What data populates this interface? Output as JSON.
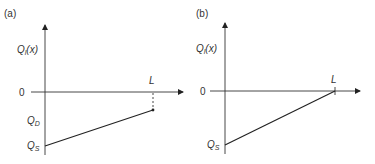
{
  "panels": [
    {
      "id": "a",
      "tag": "(a)",
      "y_label_main": "Q",
      "y_label_sub": "l",
      "y_label_arg": "(x)",
      "origin_label": "0",
      "x_end_label": "L",
      "levels": [
        {
          "main": "Q",
          "sub": "D"
        },
        {
          "main": "Q",
          "sub": "S"
        }
      ],
      "description": "Linear increase from Q_S at x=0 to Q_D at x=L (Q_D < 0)"
    },
    {
      "id": "b",
      "tag": "(b)",
      "y_label_main": "Q",
      "y_label_sub": "l",
      "y_label_arg": "(x)",
      "origin_label": "0",
      "x_end_label": "L",
      "levels": [
        {
          "main": "Q",
          "sub": "S"
        }
      ],
      "description": "Linear increase from Q_S at x=0 to 0 at x=L"
    }
  ]
}
